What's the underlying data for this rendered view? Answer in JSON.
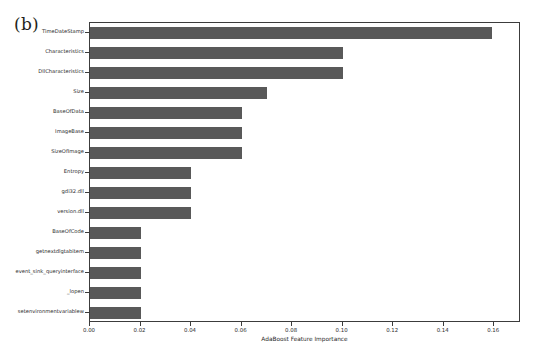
{
  "figure": {
    "subfigure_label": "(b)",
    "bar_color": "#595959",
    "axis_color": "#3c3c3c",
    "background_color": "#ffffff"
  },
  "chart_data": {
    "type": "bar",
    "orientation": "horizontal",
    "title": "",
    "xlabel": "AdaBoost Feature Importance",
    "ylabel": "",
    "xlim": [
      0.0,
      0.1706
    ],
    "xticks": [
      "0.00",
      "0.02",
      "0.04",
      "0.06",
      "0.08",
      "0.10",
      "0.12",
      "0.14",
      "0.16"
    ],
    "xtick_values": [
      0.0,
      0.02,
      0.04,
      0.06,
      0.08,
      0.1,
      0.12,
      0.14,
      0.16
    ],
    "grid": false,
    "legend": false,
    "categories": [
      "TimeDateStamp",
      "Characteristics",
      "DllCharacteristics",
      "Size",
      "BaseOfData",
      "ImageBase",
      "SizeOfImage",
      "Entropy",
      "gdi32.dll",
      "version.dll",
      "BaseOfCode",
      "getnextdlgtabitem",
      "event_sink_queryinterface",
      "_lopen",
      "setenvironmentvariablew"
    ],
    "values": [
      0.159,
      0.1,
      0.1,
      0.07,
      0.06,
      0.06,
      0.06,
      0.04,
      0.04,
      0.04,
      0.02,
      0.02,
      0.02,
      0.02,
      0.02
    ]
  }
}
